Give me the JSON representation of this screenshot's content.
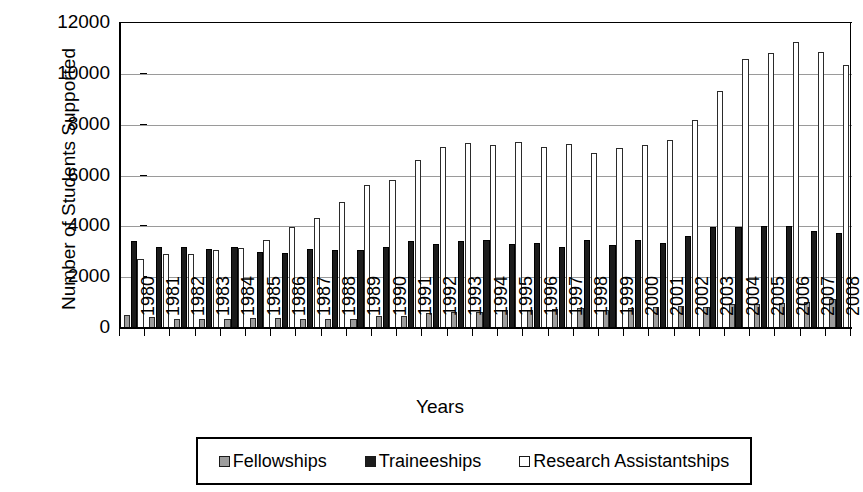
{
  "chart_data": {
    "type": "bar",
    "title": "",
    "xlabel": "Years",
    "ylabel": "Number of Students Supported",
    "ylim": [
      0,
      12000
    ],
    "ytick_values": [
      0,
      2000,
      4000,
      6000,
      8000,
      10000,
      12000
    ],
    "ytick_labels": [
      "0",
      "2000",
      "4000",
      "6000",
      "8000",
      "10000",
      "12000"
    ],
    "grid": true,
    "legend_position": "bottom",
    "categories": [
      "1980",
      "1981",
      "1982",
      "1983",
      "1984",
      "1985",
      "1986",
      "1987",
      "1988",
      "1989",
      "1990",
      "1991",
      "1992",
      "1993",
      "1994",
      "1995",
      "1996",
      "1997",
      "1998",
      "1999",
      "2000",
      "2001",
      "2002",
      "2003",
      "2004",
      "2005",
      "2006",
      "2007",
      "2008"
    ],
    "series": [
      {
        "name": "Fellowships",
        "color": "#9d9d9d",
        "values": [
          500,
          420,
          350,
          340,
          340,
          400,
          390,
          350,
          340,
          350,
          480,
          470,
          600,
          640,
          640,
          700,
          720,
          760,
          780,
          700,
          800,
          820,
          870,
          840,
          950,
          930,
          980,
          1030,
          1150
        ]
      },
      {
        "name": "Traineeships",
        "color": "#1c1c1c",
        "values": [
          3420,
          3200,
          3180,
          3120,
          3180,
          3000,
          2950,
          3120,
          3080,
          3080,
          3200,
          3440,
          3320,
          3420,
          3480,
          3320,
          3350,
          3180,
          3450,
          3260,
          3450,
          3350,
          3620,
          3980,
          3980,
          4010,
          4000,
          3800,
          3730
        ]
      },
      {
        "name": "Research Assistantships",
        "color": "#ffffff",
        "values": [
          2700,
          2930,
          2900,
          3050,
          3160,
          3480,
          3960,
          4340,
          4950,
          5620,
          5840,
          6600,
          7130,
          7280,
          7220,
          7300,
          7130,
          7250,
          6870,
          7080,
          7200,
          7380,
          8200,
          9320,
          10600,
          10820,
          11240,
          10840,
          10330
        ]
      }
    ]
  },
  "legend": {
    "items": [
      {
        "label": "Fellowships",
        "swatch": "fellowships-swatch"
      },
      {
        "label": "Traineeships",
        "swatch": "traineeships-swatch"
      },
      {
        "label": "Research Assistantships",
        "swatch": "research-assistantships-swatch"
      }
    ]
  }
}
